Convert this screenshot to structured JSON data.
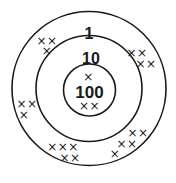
{
  "diagram": {
    "type": "concentric-target",
    "colors": {
      "stroke": "#1a1a1a",
      "background": "#ffffff"
    },
    "rings": [
      {
        "label": "1",
        "radius": 77
      },
      {
        "label": "10",
        "radius": 53
      },
      {
        "label": "100",
        "radius": 26
      }
    ],
    "marks": [
      {
        "ring": "1",
        "text": "××"
      },
      {
        "ring": "1",
        "text": "×"
      },
      {
        "ring": "1",
        "text": "××"
      },
      {
        "ring": "1",
        "text": "××"
      },
      {
        "ring": "100",
        "text": "×"
      },
      {
        "ring": "100",
        "text": "××"
      },
      {
        "ring": "1",
        "text": "××"
      },
      {
        "ring": "1",
        "text": "×"
      },
      {
        "ring": "1",
        "text": "×××"
      },
      {
        "ring": "1",
        "text": "××"
      },
      {
        "ring": "1",
        "text": "××"
      },
      {
        "ring": "1",
        "text": "××"
      },
      {
        "ring": "1",
        "text": "×"
      }
    ]
  }
}
